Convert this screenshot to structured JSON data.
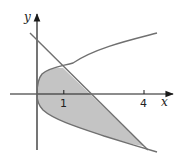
{
  "figure": {
    "axes": {
      "x_label": "x",
      "y_label": "y",
      "x_ticks": [
        {
          "value": 1,
          "label": "1"
        },
        {
          "value": 4,
          "label": "4"
        }
      ]
    },
    "curves": [
      {
        "name": "parabola",
        "equation": "x = y^2"
      },
      {
        "name": "line",
        "equation": "x + y = 2"
      }
    ],
    "intersections": [
      {
        "x": 1,
        "y": 1
      },
      {
        "x": 4,
        "y": -2
      }
    ],
    "region": {
      "shaded": true,
      "fill": "#c4c4c4"
    },
    "colors": {
      "axes": "#1a1a1a",
      "curves": "#707070",
      "shade": "#c4c4c4"
    }
  }
}
